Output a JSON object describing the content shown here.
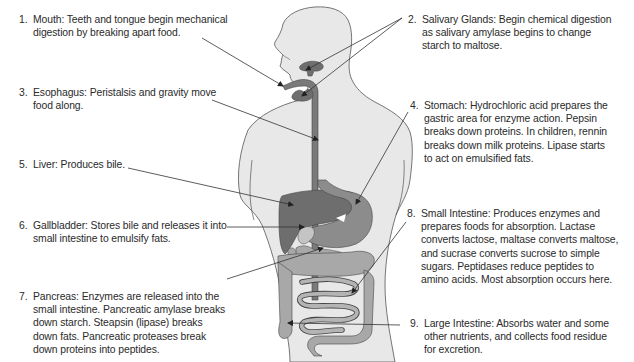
{
  "diagram": {
    "type": "labeled anatomical diagram",
    "colors": {
      "body_fill": "#e8e8e8",
      "body_outline": "#555555",
      "organ_dark": "#6e6e6e",
      "organ_mid": "#8c8c8c",
      "organ_light": "#a8a8a8",
      "organ_lighter": "#c4c4c4",
      "leader_line": "#333333",
      "text": "#2a2a2a"
    }
  },
  "labels": [
    {
      "num": "1.",
      "name": "Mouth",
      "text": "Mouth: Teeth and tongue begin mechanical digestion by breaking apart food."
    },
    {
      "num": "2.",
      "name": "Salivary Glands",
      "text": "Salivary Glands: Begin chemical digestion as salivary amylase begins to change starch to maltose."
    },
    {
      "num": "3.",
      "name": "Esophagus",
      "text": "Esophagus: Peristalsis and gravity move food along."
    },
    {
      "num": "4.",
      "name": "Stomach",
      "text": "Stomach: Hydrochloric acid prepares the gastric area for enzyme action. Pepsin breaks down proteins. In children, rennin breaks down milk proteins. Lipase starts to act on emulsified fats."
    },
    {
      "num": "5.",
      "name": "Liver",
      "text": "Liver: Produces bile."
    },
    {
      "num": "6.",
      "name": "Gallbladder",
      "text": "Gallbladder: Stores bile and releases it into small intestine to emulsify fats."
    },
    {
      "num": "7.",
      "name": "Pancreas",
      "text": "Pancreas: Enzymes are released into the small intestine. Pancreatic amylase breaks down starch. Steapsin (lipase) breaks down fats. Pancreatic proteases break down proteins into peptides."
    },
    {
      "num": "8.",
      "name": "Small Intestine",
      "text": "Small Intestine: Produces enzymes and prepares foods for absorption. Lactase converts lactose, maltase converts maltose, and sucrase converts sucrose to simple sugars. Peptidases reduce peptides to amino acids. Most absorption occurs here."
    },
    {
      "num": "9.",
      "name": "Large Intestine",
      "text": "Large Intestine: Absorbs water and some other nutrients, and collects food residue for excretion."
    }
  ]
}
